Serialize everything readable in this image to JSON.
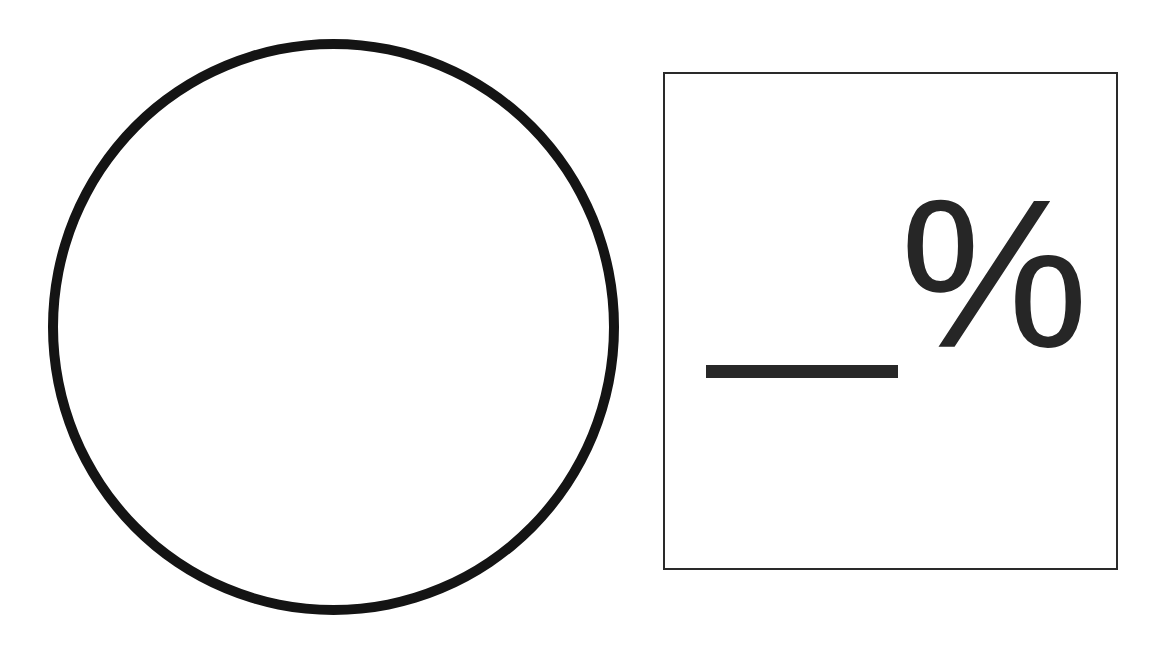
{
  "diagram": {
    "shapes": [
      {
        "type": "circle",
        "fill": "#ffffff",
        "stroke": "#141414"
      },
      {
        "type": "answer-box",
        "stroke": "#2a2a2a"
      }
    ],
    "answer_box": {
      "blank": "",
      "suffix": "%"
    }
  }
}
